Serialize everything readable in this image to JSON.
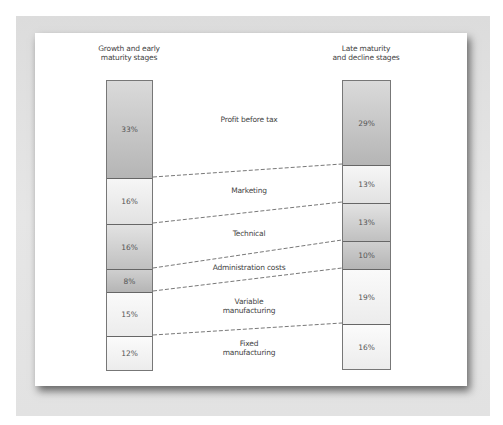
{
  "diagram": {
    "left_title": [
      "Growth and early",
      "maturity stages"
    ],
    "right_title": [
      "Late maturity",
      "and decline stages"
    ],
    "categories": [
      {
        "name": "Profit before tax",
        "left": "33%",
        "right": "29%"
      },
      {
        "name": "Marketing",
        "left": "16%",
        "right": "13%"
      },
      {
        "name": "Technical",
        "left": "16%",
        "right": "13%"
      },
      {
        "name": "Administration costs",
        "left": "8%",
        "right": "10%"
      },
      {
        "name": "Variable manufacturing",
        "left": "15%",
        "right": "19%"
      },
      {
        "name": "Fixed manufacturing",
        "left": "12%",
        "right": "16%"
      }
    ],
    "labels": {
      "profit": "Profit before tax",
      "marketing": "Marketing",
      "technical": "Technical",
      "admin": "Administration costs",
      "variable_1": "Variable",
      "variable_2": "manufacturing",
      "fixed_1": "Fixed",
      "fixed_2": "manufacturing"
    },
    "left_values": [
      "33%",
      "16%",
      "16%",
      "8%",
      "15%",
      "12%"
    ],
    "right_values": [
      "29%",
      "13%",
      "13%",
      "10%",
      "19%",
      "16%"
    ],
    "colors": {
      "dark_segment": "#b8b8b8",
      "light_segment": "#f0f0f0",
      "border": "#666666",
      "frame": "#e0e0e0"
    }
  }
}
